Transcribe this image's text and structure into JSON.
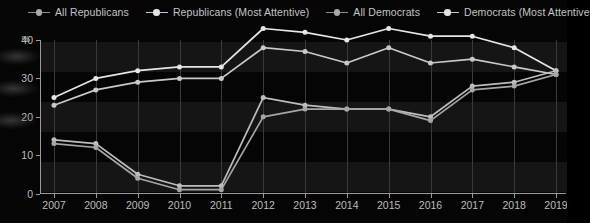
{
  "legend": {
    "position": "top",
    "items": [
      {
        "label": "All Republicans",
        "marker": "line-dot",
        "color": "#8e8e8e"
      },
      {
        "label": "Republicans (Most Attentive)",
        "marker": "line-dot",
        "color": "#e2e2e2"
      },
      {
        "label": "All Democrats",
        "marker": "line-dot",
        "color": "#a8a8a8"
      },
      {
        "label": "Democrats (Most Attentive",
        "marker": "line-dot",
        "color": "#e2e2e2"
      }
    ]
  },
  "axis": {
    "y_unit": "%",
    "y_ticks": [
      "40",
      "30",
      "20",
      "10",
      "0"
    ],
    "x_ticks": [
      "2007",
      "2008",
      "2009",
      "2010",
      "2011",
      "2012",
      "2013",
      "2014",
      "2015",
      "2016",
      "2017",
      "2018",
      "2019"
    ]
  },
  "chart_data": {
    "type": "line",
    "title": "",
    "xlabel": "",
    "ylabel": "%",
    "ylim": [
      0,
      40
    ],
    "grid": "vertical",
    "legend_position": "top",
    "categories": [
      "2007",
      "2008",
      "2009",
      "2010",
      "2011",
      "2012",
      "2013",
      "2014",
      "2015",
      "2016",
      "2017",
      "2018",
      "2019"
    ],
    "series": [
      {
        "name": "Democrats (Most Attentive)",
        "color": "#e6e6e6",
        "values": [
          25,
          30,
          32,
          33,
          33,
          43,
          42,
          40,
          43,
          41,
          41,
          38,
          32
        ]
      },
      {
        "name": "All Democrats",
        "color": "#c9c9c9",
        "values": [
          23,
          27,
          29,
          30,
          30,
          38,
          37,
          34,
          38,
          34,
          35,
          33,
          31
        ]
      },
      {
        "name": "Republicans (Most Attentive)",
        "color": "#bdbdbd",
        "values": [
          14,
          13,
          5,
          2,
          2,
          25,
          23,
          22,
          22,
          20,
          28,
          29,
          32
        ]
      },
      {
        "name": "All Republicans",
        "color": "#a6a6a6",
        "values": [
          13,
          12,
          4,
          1,
          1,
          20,
          22,
          22,
          22,
          19,
          27,
          28,
          31
        ]
      }
    ]
  }
}
